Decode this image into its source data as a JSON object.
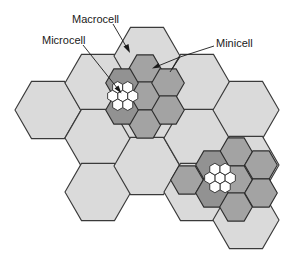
{
  "diagram": {
    "type": "hexagonal cellular network hierarchy",
    "labels": {
      "macrocell": "Macrocell",
      "microcell": "Microcell",
      "minicell": "Minicell"
    },
    "colors": {
      "macrocell_fill": "#dadada",
      "minicell_fill": "#a3a3a3",
      "minicell_dark_fill": "#929292",
      "microcell_fill": "#ffffff",
      "outline": "#333333"
    },
    "macrocells": {
      "radius": 33,
      "orientation": "flat-top",
      "centers": [
        [
          48,
          110
        ],
        [
          98,
          83
        ],
        [
          98,
          138
        ],
        [
          98,
          192
        ],
        [
          147,
          56
        ],
        [
          147,
          111
        ],
        [
          147,
          166
        ],
        [
          197,
          83
        ],
        [
          197,
          138
        ],
        [
          197,
          192
        ],
        [
          246,
          110
        ],
        [
          246,
          165
        ],
        [
          246,
          220
        ]
      ]
    },
    "minicell_clusters": [
      {
        "radius": 16.3,
        "orientation": "flat-top",
        "cells": [
          {
            "c": [
              145,
              69
            ],
            "shade": "mid"
          },
          {
            "c": [
              145,
              96
            ],
            "shade": "mid"
          },
          {
            "c": [
              145,
              124
            ],
            "shade": "mid"
          },
          {
            "c": [
              122,
              83
            ],
            "shade": "dark"
          },
          {
            "c": [
              122,
              110
            ],
            "shade": "dark"
          },
          {
            "c": [
              168,
              83
            ],
            "shade": "mid"
          },
          {
            "c": [
              168,
              110
            ],
            "shade": "mid"
          }
        ]
      },
      {
        "radius": 16.3,
        "orientation": "flat-top",
        "cells": [
          {
            "c": [
              236,
              152
            ],
            "shade": "mid"
          },
          {
            "c": [
              212,
              165
            ],
            "shade": "dark"
          },
          {
            "c": [
              261,
              165
            ],
            "shade": "mid"
          },
          {
            "c": [
              187,
              180
            ],
            "shade": "mid"
          },
          {
            "c": [
              236,
              180
            ],
            "shade": "mid"
          },
          {
            "c": [
              212,
              193
            ],
            "shade": "dark"
          },
          {
            "c": [
              261,
              193
            ],
            "shade": "mid"
          },
          {
            "c": [
              236,
              207
            ],
            "shade": "mid"
          }
        ]
      }
    ],
    "microcell_clusters": [
      {
        "center": [
          122.7,
          96
        ],
        "radius": 5.8,
        "orientation": "pointy-top"
      },
      {
        "center": [
          220,
          178
        ],
        "radius": 5.9,
        "orientation": "pointy-top"
      }
    ]
  }
}
